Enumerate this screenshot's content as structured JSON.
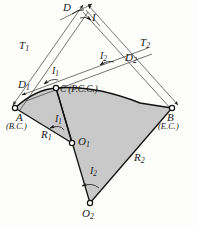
{
  "figure": {
    "type": "compound-curve-survey-diagram",
    "colors": {
      "fill": "#c9c9c9",
      "stroke": "#1a1a1a",
      "thin_stroke": "#3a3a3a",
      "background": "#fdfdfc"
    }
  },
  "points": {
    "A": {
      "label": "A",
      "note": "(B.C.)",
      "x": 15,
      "y": 108
    },
    "B": {
      "label": "B",
      "note": "(E.C.)",
      "x": 172,
      "y": 108
    },
    "C": {
      "label": "C",
      "note": "(P.C.C.)",
      "x": 56,
      "y": 88
    },
    "O1": {
      "label": "O",
      "sub": "1",
      "x": 72,
      "y": 143
    },
    "O2": {
      "label": "O",
      "sub": "2",
      "x": 90,
      "y": 203
    },
    "V": {
      "label": "V",
      "x": 85,
      "y": 8
    }
  },
  "labels": {
    "T1": {
      "base": "T",
      "sub": "1",
      "x": 22,
      "y": 45
    },
    "T2": {
      "base": "T",
      "sub": "2",
      "x": 143,
      "y": 43
    },
    "D": {
      "base": "D",
      "sub": "",
      "x": 67,
      "y": 6
    },
    "D1": {
      "base": "D",
      "sub": "1",
      "x": 21,
      "y": 84
    },
    "D2": {
      "base": "D",
      "sub": "2",
      "x": 128,
      "y": 58
    },
    "I": {
      "base": "I",
      "sub": "",
      "x": 93,
      "y": 16
    },
    "I1_top": {
      "base": "I",
      "sub": "1",
      "x": 52,
      "y": 72
    },
    "I1_bot": {
      "base": "I",
      "sub": "1",
      "x": 55,
      "y": 120
    },
    "I2_top": {
      "base": "I",
      "sub": "2",
      "x": 104,
      "y": 57
    },
    "I2_bot": {
      "base": "I",
      "sub": "2",
      "x": 93,
      "y": 172
    },
    "R1": {
      "base": "R",
      "sub": "1",
      "x": 44,
      "y": 134
    },
    "R2": {
      "base": "R",
      "sub": "2",
      "x": 137,
      "y": 158
    },
    "A": {
      "base": "A",
      "sub": "",
      "x": 17,
      "y": 118
    },
    "A_note": {
      "text": "(B.C.)",
      "x": 7,
      "y": 128
    },
    "B": {
      "base": "B",
      "sub": "",
      "x": 168,
      "y": 118
    },
    "B_note": {
      "text": "(E.C.)",
      "x": 160,
      "y": 128
    },
    "C_note": {
      "text": "C (P.C.C.)",
      "x": 60,
      "y": 84
    },
    "O1": {
      "base": "O",
      "sub": "1",
      "x": 80,
      "y": 139
    },
    "O2": {
      "base": "O",
      "sub": "2",
      "x": 84,
      "y": 209
    }
  }
}
